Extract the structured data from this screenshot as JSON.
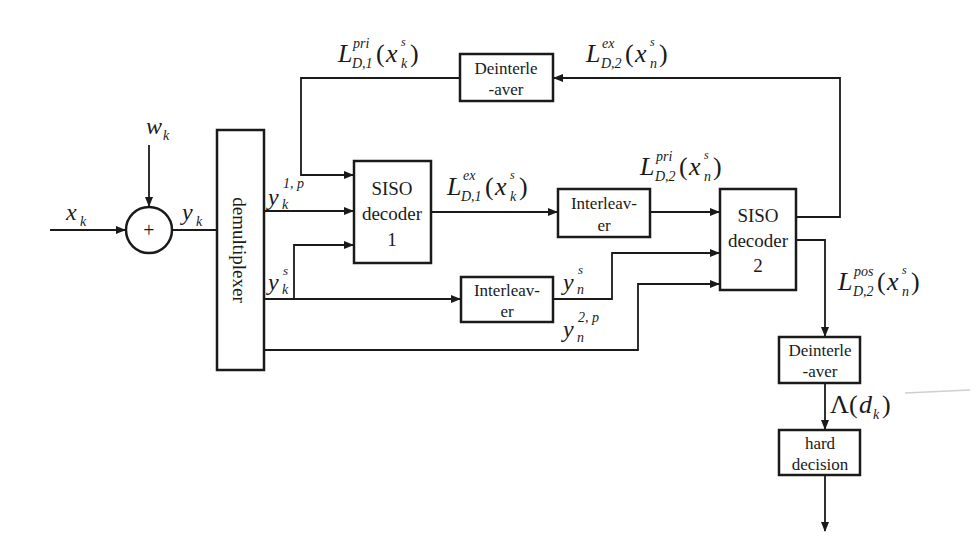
{
  "diagram": {
    "type": "turbo-decoder-block-diagram",
    "blocks": {
      "demultiplexer": "demultiplexer",
      "siso1": {
        "line1": "SISO",
        "line2": "decoder",
        "line3": "1"
      },
      "siso2": {
        "line1": "SISO",
        "line2": "decoder",
        "line3": "2"
      },
      "interleaver_mid": {
        "line1": "Interleav-",
        "line2": "er"
      },
      "interleaver_bottom": {
        "line1": "Interleav-",
        "line2": "er"
      },
      "deinterleaver_top": {
        "line1": "Deinterle",
        "line2": "-aver"
      },
      "deinterleaver_out": {
        "line1": "Deinterle",
        "line2": "-aver"
      },
      "hard_decision": {
        "line1": "hard",
        "line2": "decision"
      },
      "adder": "+"
    },
    "signals": {
      "input": {
        "base": "x",
        "sub": "k"
      },
      "noise": {
        "base": "w",
        "sub": "k"
      },
      "adder_out": {
        "base": "y",
        "sub": "k"
      },
      "parity1": {
        "base": "y",
        "sub": "k",
        "sup": "1, p"
      },
      "systematic": {
        "base": "y",
        "sub": "k",
        "sup": "s"
      },
      "systematic_interleaved": {
        "base": "y",
        "sub": "n",
        "sup": "s"
      },
      "parity2": {
        "base": "y",
        "sub": "n",
        "sup": "2, p"
      },
      "L_pri_D1": {
        "base": "L",
        "sup": "pri",
        "sub": "D,1",
        "arg": "x",
        "arg_sup": "s",
        "arg_sub": "k"
      },
      "L_ex_D1": {
        "base": "L",
        "sup": "ex",
        "sub": "D,1",
        "arg": "x",
        "arg_sup": "s",
        "arg_sub": "k"
      },
      "L_pri_D2": {
        "base": "L",
        "sup": "pri",
        "sub": "D,2",
        "arg": "x",
        "arg_sup": "s",
        "arg_sub": "n"
      },
      "L_ex_D2": {
        "base": "L",
        "sup": "ex",
        "sub": "D,2",
        "arg": "x",
        "arg_sup": "s",
        "arg_sub": "n"
      },
      "L_pos_D2": {
        "base": "L",
        "sup": "pos",
        "sub": "D,2",
        "arg": "x",
        "arg_sup": "s",
        "arg_sub": "n"
      },
      "lambda": {
        "base": "Λ",
        "arg": "d",
        "arg_sub": "k"
      }
    },
    "colors": {
      "line": "#1a1a1a",
      "background": "#ffffff"
    }
  }
}
